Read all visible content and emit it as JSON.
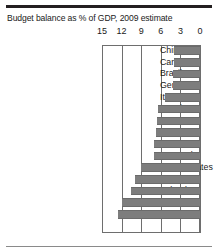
{
  "chart_data": {
    "type": "bar",
    "title": "Budget balance as % of GDP, 2009 estimate",
    "xlabel": "",
    "ylabel": "",
    "orientation": "horizontal",
    "axis_reversed": true,
    "grid": true,
    "legend": "none",
    "xlim": [
      15,
      0
    ],
    "xticks": [
      15,
      12,
      9,
      6,
      3,
      0
    ],
    "tick_labels": [
      "15",
      "12",
      "9",
      "6",
      "3",
      "0"
    ],
    "note": "Values are budget deficits plotted as positive magnitudes extending leftward from the zero axis.",
    "categories": [
      "China",
      "Canada",
      "Brazil",
      "Germany",
      "Italy",
      "Russia",
      "Japan",
      "France",
      "India",
      "Portugal",
      "United States",
      "Spain",
      "Ireland",
      "Greece",
      "Britain"
    ],
    "values": [
      4.0,
      4.0,
      4.1,
      4.2,
      5.3,
      6.5,
      6.6,
      6.7,
      7.0,
      7.1,
      9.0,
      10.0,
      10.6,
      12.0,
      12.6
    ]
  },
  "style": {
    "bar_color": "#7d7d7d",
    "frame_color": "#6e6e6e",
    "text_color": "#1a1a1a",
    "rule_color": "#231f20",
    "background": "#ffffff"
  }
}
